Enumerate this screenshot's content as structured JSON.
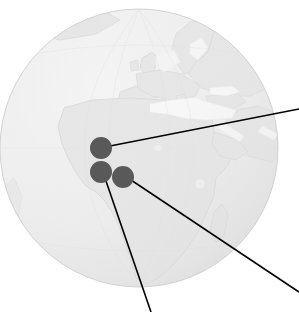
{
  "figure": {
    "type": "globe-map-with-callouts",
    "canvas": {
      "width": 299,
      "height": 312
    },
    "background_color": "#ffffff"
  },
  "globe": {
    "label": "Earth globe centred on Africa",
    "center_x": 139,
    "center_y": 148,
    "radius": 139,
    "ocean_color": "#eeeeee",
    "land_color": "#e2e2e2",
    "sea_color": "#fbfbfb",
    "outline_color": "#d2d2d2",
    "shadow_color": "#e6e6e6"
  },
  "landmasses": [
    {
      "name": "africa"
    },
    {
      "name": "europe"
    },
    {
      "name": "scandinavia"
    },
    {
      "name": "iberia"
    },
    {
      "name": "arabia"
    },
    {
      "name": "madagascar"
    },
    {
      "name": "british-isles"
    },
    {
      "name": "greenland-edge"
    }
  ],
  "water_bodies": [
    {
      "name": "mediterranean-sea"
    },
    {
      "name": "black-sea"
    },
    {
      "name": "red-sea"
    },
    {
      "name": "baltic-sea"
    },
    {
      "name": "north-sea"
    },
    {
      "name": "lake-victoria"
    },
    {
      "name": "lake-chad"
    }
  ],
  "markers": [
    {
      "id": "marker-1",
      "label": "",
      "cx": 101,
      "cy": 148,
      "r": 11,
      "color": "#595959"
    },
    {
      "id": "marker-2",
      "label": "",
      "cx": 101,
      "cy": 172,
      "r": 11,
      "color": "#595959"
    },
    {
      "id": "marker-3",
      "label": "",
      "cx": 123,
      "cy": 177,
      "r": 11,
      "color": "#595959"
    }
  ],
  "leader_lines": [
    {
      "id": "leader-line-1",
      "from_marker": "marker-1",
      "x1": 110,
      "y1": 146,
      "x2": 299,
      "y2": 109,
      "color": "#000000",
      "width": 1.6
    },
    {
      "id": "leader-line-2",
      "from_marker": "marker-3",
      "x1": 131,
      "y1": 180,
      "x2": 299,
      "y2": 292,
      "color": "#000000",
      "width": 1.6
    },
    {
      "id": "leader-line-3",
      "from_marker": "marker-2",
      "x1": 106,
      "y1": 181,
      "x2": 151,
      "y2": 312,
      "color": "#000000",
      "width": 1.6
    }
  ]
}
